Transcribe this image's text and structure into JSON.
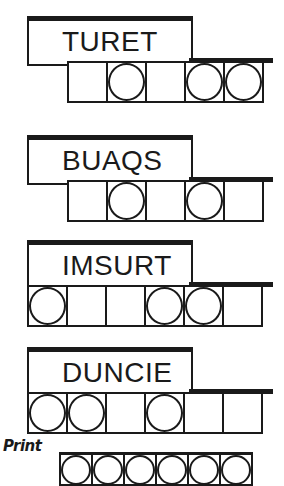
{
  "puzzles": [
    {
      "word": "TURET",
      "top": 16,
      "cells_left": 67,
      "cell_count": 5,
      "circles": [
        false,
        true,
        false,
        true,
        true
      ],
      "ext_left": 189,
      "ext_width": 84
    },
    {
      "word": "BUAQS",
      "top": 135,
      "cells_left": 67,
      "cell_count": 5,
      "circles": [
        false,
        true,
        false,
        true,
        false
      ],
      "ext_left": 189,
      "ext_width": 84
    },
    {
      "word": "IMSURT",
      "top": 240,
      "cells_left": 27,
      "cell_count": 6,
      "circles": [
        true,
        false,
        false,
        true,
        true,
        false
      ],
      "ext_left": 189,
      "ext_width": 84
    },
    {
      "word": "DUNCIE",
      "top": 347,
      "cells_left": 27,
      "cell_count": 6,
      "circles": [
        true,
        true,
        false,
        true,
        false,
        false
      ],
      "ext_left": 189,
      "ext_width": 84
    }
  ],
  "footer": {
    "print_label": "Print",
    "answer_cells": 6
  }
}
